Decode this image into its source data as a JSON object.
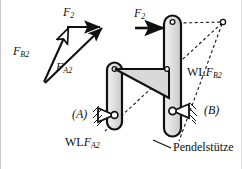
{
  "figure": {
    "background_color": "#ffffff",
    "line_color": "#111111",
    "fill_gray": "#d9d9d9"
  },
  "force_triangle": {
    "name": "force-triangle",
    "vectors": [
      {
        "id": "F2",
        "label_main": "F",
        "label_sub": "2",
        "direction": "horizontal-right"
      },
      {
        "id": "FB2",
        "label_main": "F",
        "label_sub": "B2",
        "direction": "up-right-steep"
      },
      {
        "id": "FA2",
        "label_main": "F",
        "label_sub": "A2",
        "direction": "up-right-shallow"
      }
    ],
    "labels": {
      "f2": {
        "main": "F",
        "sub": "2"
      },
      "fb2": {
        "main": "F",
        "sub": "B2"
      },
      "fa2": {
        "main": "F",
        "sub": "A2"
      }
    }
  },
  "mechanism": {
    "name": "four-bar-mechanism",
    "applied_force": {
      "main": "F",
      "sub": "2"
    },
    "supports": [
      {
        "id": "A",
        "label": "(A)"
      },
      {
        "id": "B",
        "label": "(B)"
      }
    ],
    "construction_labels": [
      {
        "id": "WLFA2",
        "prefix": "WL",
        "main": "F",
        "sub": "A2"
      },
      {
        "id": "WLFB2",
        "prefix": "WL",
        "main": "F",
        "sub": "B2"
      }
    ],
    "callout": {
      "id": "pendelstuetze",
      "text": "Pendelstütze"
    }
  }
}
